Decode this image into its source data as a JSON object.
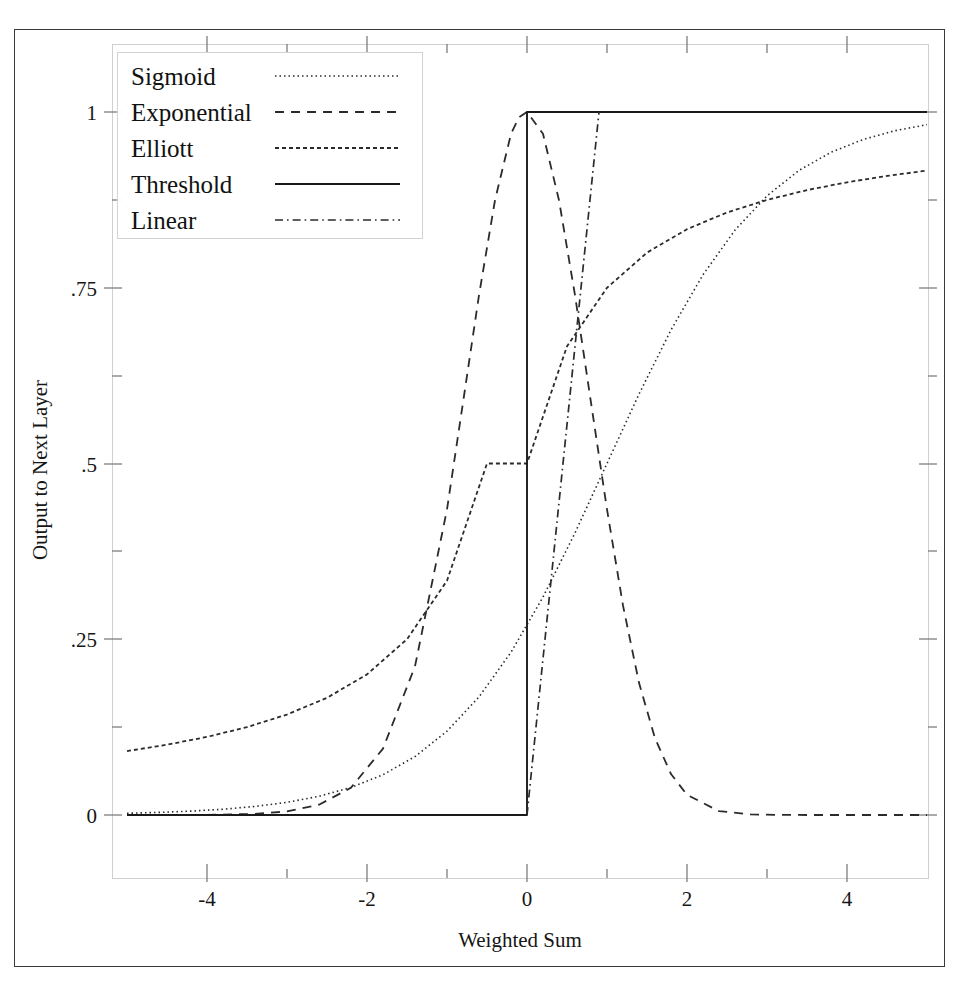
{
  "chart_data": {
    "type": "line",
    "title": "",
    "xlabel": "Weighted Sum",
    "ylabel": "Output to Next Layer",
    "xlim": [
      -5,
      5
    ],
    "ylim": [
      -0.09,
      1.09
    ],
    "grid": false,
    "legend_position": "upper-left",
    "x_ticks": [
      -4,
      -2,
      0,
      2,
      4
    ],
    "x_tick_labels": [
      "-4",
      "-2",
      "0",
      "2",
      "4"
    ],
    "x_minor_ticks": [
      -5,
      -3,
      -1,
      1,
      3,
      5
    ],
    "y_ticks": [
      0,
      0.25,
      0.5,
      0.75,
      1
    ],
    "y_tick_labels": [
      "0",
      ".25",
      ".5",
      ".75",
      "1"
    ],
    "y_minor_ticks": [
      0.125,
      0.375,
      0.625,
      0.875
    ],
    "series": [
      {
        "name": "Sigmoid",
        "dash": "dotted",
        "color": "#2b2b2b",
        "x": [
          -5,
          -4.6,
          -4.2,
          -3.8,
          -3.4,
          -3,
          -2.6,
          -2.2,
          -1.8,
          -1.4,
          -1,
          -0.6,
          -0.2,
          0.2,
          0.6,
          1,
          1.4,
          1.8,
          2.2,
          2.6,
          3,
          3.4,
          3.8,
          4.2,
          4.6,
          5
        ],
        "y": [
          0.0025,
          0.0037,
          0.0055,
          0.0082,
          0.0122,
          0.018,
          0.0266,
          0.0392,
          0.0573,
          0.0831,
          0.1192,
          0.168,
          0.2315,
          0.31,
          0.4013,
          0.5,
          0.5987,
          0.69,
          0.7685,
          0.832,
          0.8808,
          0.9169,
          0.9427,
          0.9608,
          0.9734,
          0.982
        ]
      },
      {
        "name": "Exponential",
        "dash": "dashed",
        "color": "#2b2b2b",
        "x": [
          -5,
          -4.6,
          -4.2,
          -3.8,
          -3.4,
          -3,
          -2.6,
          -2.2,
          -1.8,
          -1.4,
          -1,
          -0.8,
          -0.6,
          -0.4,
          -0.2,
          -0.1,
          0,
          0.2,
          0.4,
          0.6,
          0.8,
          1,
          1.2,
          1.4,
          1.6,
          1.8,
          2,
          2.4,
          2.8,
          3.2,
          3.6,
          4,
          4.4,
          5
        ],
        "y": [
          0.0,
          0.0,
          0.0,
          0.0005,
          0.0016,
          0.005,
          0.0146,
          0.0388,
          0.0945,
          0.2115,
          0.4346,
          0.5866,
          0.7394,
          0.8745,
          0.969,
          0.9923,
          1.0,
          0.969,
          0.8745,
          0.7394,
          0.5866,
          0.4346,
          0.298,
          0.188,
          0.1092,
          0.0583,
          0.0287,
          0.0055,
          0.0008,
          0.0001,
          0.0,
          0.0,
          0.0,
          0.0
        ]
      },
      {
        "name": "Elliott",
        "dash": "fine-dashed",
        "color": "#2b2b2b",
        "x": [
          -5,
          -4.5,
          -4,
          -3.5,
          -3,
          -2.5,
          -2,
          -1.5,
          -1,
          -0.5,
          0,
          0.5,
          1,
          1.5,
          2,
          2.5,
          3,
          3.5,
          4,
          4.5,
          5
        ],
        "y": [
          0.0909,
          0.1,
          0.1111,
          0.125,
          0.1429,
          0.1667,
          0.2,
          0.25,
          0.3333,
          0.5,
          0.5,
          0.6667,
          0.75,
          0.8,
          0.8333,
          0.8571,
          0.875,
          0.8889,
          0.9,
          0.9091,
          0.9167
        ]
      },
      {
        "name": "Threshold",
        "dash": "solid",
        "color": "#1a1a1a",
        "x": [
          -5,
          0,
          0,
          5
        ],
        "y": [
          0,
          0,
          1,
          1
        ]
      },
      {
        "name": "Linear",
        "dash": "dash-dot",
        "color": "#2b2b2b",
        "x": [
          0,
          0.9
        ],
        "y": [
          0,
          1.0
        ]
      }
    ]
  },
  "legend": {
    "entries": [
      {
        "label": "Sigmoid",
        "dash": "dotted"
      },
      {
        "label": "Exponential",
        "dash": "dashed"
      },
      {
        "label": "Elliott",
        "dash": "fine-dashed"
      },
      {
        "label": "Threshold",
        "dash": "solid"
      },
      {
        "label": "Linear",
        "dash": "dash-dot"
      }
    ]
  },
  "axes": {
    "x_title": "Weighted Sum",
    "y_title": "Output to Next Layer",
    "x_labels": [
      "-4",
      "-2",
      "0",
      "2",
      "4"
    ],
    "y_labels": [
      "1",
      ".75",
      ".5",
      ".25",
      "0"
    ]
  },
  "colors": {
    "ink": "#1a1a1a",
    "frame": "#c9c9c9",
    "page_border": "#3a3a3a",
    "background": "#ffffff"
  }
}
